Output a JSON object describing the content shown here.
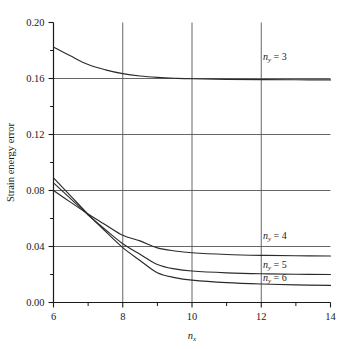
{
  "chart_data": {
    "type": "line",
    "title": "",
    "subtitle": "",
    "xlabel": "n_x",
    "xlabel_base": "n",
    "xlabel_sub": "x",
    "ylabel": "Strain energy error",
    "xlim": [
      6,
      14
    ],
    "ylim": [
      0.0,
      0.2
    ],
    "grid": true,
    "grid_x": [
      8,
      10,
      12
    ],
    "grid_y": [
      0.04,
      0.08,
      0.12,
      0.16
    ],
    "legend_position": "inline-right",
    "x_ticks_major": [
      6,
      8,
      10,
      12,
      14
    ],
    "x_ticks_major_labels": [
      "6",
      "8",
      "10",
      "12",
      "14"
    ],
    "x_ticks_minor": [
      7,
      9,
      11,
      13
    ],
    "y_ticks_major": [
      0.0,
      0.04,
      0.08,
      0.12,
      0.16,
      0.2
    ],
    "y_ticks_major_labels": [
      "0.00",
      "0.04",
      "0.08",
      "0.12",
      "0.16",
      "0.20"
    ],
    "y_ticks_minor": [
      0.02,
      0.06,
      0.1,
      0.14,
      0.18
    ],
    "x": [
      6,
      6.5,
      7,
      7.5,
      8,
      8.5,
      9,
      9.5,
      10,
      11,
      12,
      13,
      14
    ],
    "series": [
      {
        "name": "n_y = 3",
        "label_base": "n",
        "label_sub": "y",
        "label_value": "= 3",
        "values": [
          0.1825,
          0.176,
          0.17,
          0.1662,
          0.1635,
          0.1618,
          0.1608,
          0.1602,
          0.1598,
          0.1594,
          0.1592,
          0.1591,
          0.159
        ],
        "label_x": 12.05,
        "label_y": 0.1735
      },
      {
        "name": "n_y = 4",
        "label_base": "n",
        "label_sub": "y",
        "label_value": "= 4",
        "values": [
          0.08,
          0.0715,
          0.0632,
          0.0555,
          0.048,
          0.044,
          0.039,
          0.0368,
          0.0355,
          0.0343,
          0.0337,
          0.0334,
          0.0332
        ],
        "label_x": 12.05,
        "label_y": 0.0455
      },
      {
        "name": "n_y = 5",
        "label_base": "n",
        "label_sub": "y",
        "label_value": "= 5",
        "values": [
          0.0855,
          0.074,
          0.0625,
          0.052,
          0.042,
          0.0345,
          0.0272,
          0.024,
          0.0225,
          0.0212,
          0.0205,
          0.0202,
          0.02
        ],
        "label_x": 12.05,
        "label_y": 0.0248
      },
      {
        "name": "n_y = 6",
        "label_base": "n",
        "label_sub": "y",
        "label_value": "= 6",
        "values": [
          0.089,
          0.076,
          0.063,
          0.0508,
          0.0392,
          0.03,
          0.0212,
          0.0178,
          0.016,
          0.0142,
          0.0132,
          0.0126,
          0.0122
        ],
        "label_x": 12.05,
        "label_y": 0.0152
      }
    ],
    "colors": {
      "axis": "#1a1a1a",
      "grid": "#555555",
      "line": "#2b2b2b",
      "background": "#ffffff"
    }
  }
}
